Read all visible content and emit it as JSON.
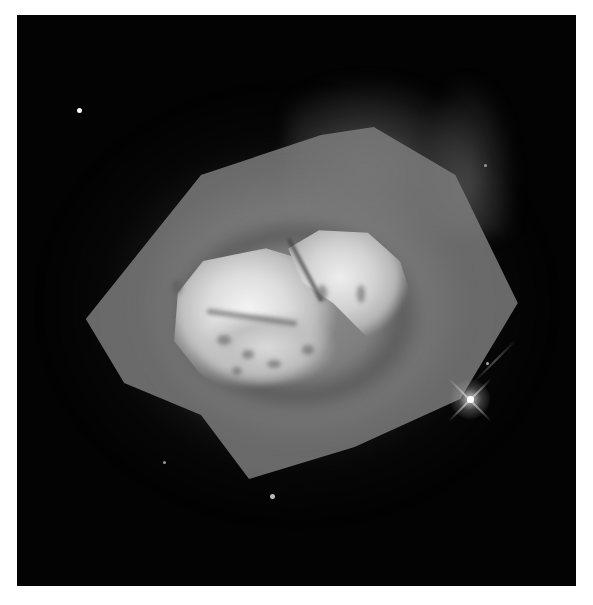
{
  "image": {
    "subject": "planetary nebula",
    "colormode": "grayscale",
    "background_color": "#ffffff",
    "frame_color": "#030303"
  },
  "stars": [
    {
      "name": "star-upper-left",
      "x": 62,
      "y": 95
    },
    {
      "name": "star-bright-spiked",
      "x": 453,
      "y": 384
    },
    {
      "name": "star-bottom",
      "x": 254,
      "y": 480
    },
    {
      "name": "star-lower-left",
      "x": 147,
      "y": 447
    },
    {
      "name": "star-right-small",
      "x": 470,
      "y": 348
    },
    {
      "name": "star-right-edge",
      "x": 468,
      "y": 150
    }
  ]
}
